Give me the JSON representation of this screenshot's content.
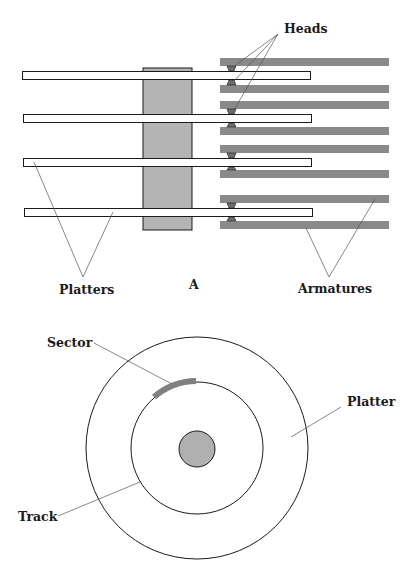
{
  "top_diagram": {
    "labels": {
      "heads": "Heads",
      "platters": "Platters",
      "figure_letter": "A",
      "armatures": "Armatures"
    }
  },
  "bottom_diagram": {
    "labels": {
      "sector": "Sector",
      "platter": "Platter",
      "track": "Track"
    }
  },
  "colors": {
    "armature": "#8a8a8a",
    "spindle": "#b4b4b4",
    "platter_fill": "#ffffff",
    "head": "#6e6e6e",
    "sector": "#808080",
    "hub": "#b0b0b0",
    "stroke": "#1a1a1a",
    "leader": "#555555"
  }
}
